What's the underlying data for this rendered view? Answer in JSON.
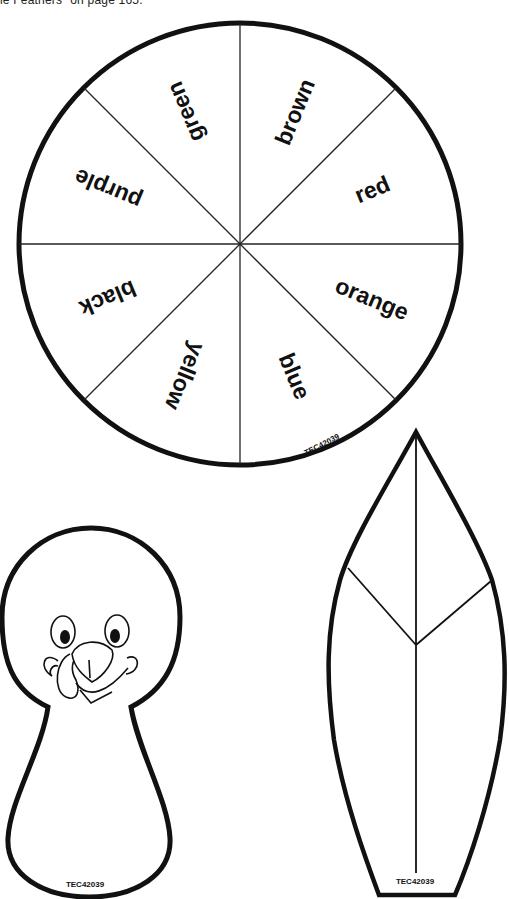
{
  "page": {
    "caption": "le Feathers\" on page 165."
  },
  "spinner": {
    "sectors": [
      {
        "label": "brown",
        "angle": 22.5
      },
      {
        "label": "red",
        "angle": 67.5
      },
      {
        "label": "orange",
        "angle": 112.5
      },
      {
        "label": "blue",
        "angle": 157.5
      },
      {
        "label": "yellow",
        "angle": 202.5
      },
      {
        "label": "black",
        "angle": 247.5
      },
      {
        "label": "purple",
        "angle": 292.5
      },
      {
        "label": "green",
        "angle": 337.5
      }
    ],
    "code": "TEC42039"
  },
  "turkey_body": {
    "code": "TEC42039"
  },
  "feather": {
    "code": "TEC42039"
  },
  "colors": {
    "ink": "#111111",
    "paper": "#ffffff"
  }
}
